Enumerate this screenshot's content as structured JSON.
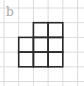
{
  "figure": {
    "label": "b",
    "grid": {
      "cols": 5,
      "rows": 5,
      "origin_x": 4,
      "origin_y": 8,
      "cell": 14.7,
      "line_color": "#dcdcdc"
    },
    "shape": {
      "stroke_color": "#2a2a2a",
      "cells": [
        {
          "col": 2,
          "row": 1
        },
        {
          "col": 3,
          "row": 1
        },
        {
          "col": 1,
          "row": 2
        },
        {
          "col": 2,
          "row": 2
        },
        {
          "col": 3,
          "row": 2
        },
        {
          "col": 1,
          "row": 3
        },
        {
          "col": 2,
          "row": 3
        },
        {
          "col": 3,
          "row": 3
        }
      ]
    }
  }
}
